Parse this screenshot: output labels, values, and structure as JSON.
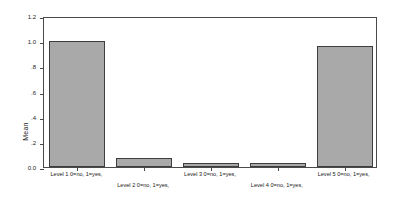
{
  "chart_data": {
    "type": "bar",
    "title": "",
    "subtitle": "",
    "xlabel": "",
    "ylabel": "Mean",
    "ylim": [
      0.0,
      1.2
    ],
    "grid": false,
    "legend": "none",
    "categories": [
      "Level 1 0=no, 1=yes,",
      "Level 2 0=no, 1=yes,",
      "Level 3 0=no, 1=yes,",
      "Level 4 0=no, 1=yes,",
      "Level 5 0=no, 1=yes,"
    ],
    "values": [
      1.0,
      0.07,
      0.03,
      0.03,
      0.96
    ],
    "ytick_labels": [
      "0.0",
      ".2",
      ".4",
      ".6",
      ".8",
      "1.0",
      "1.2"
    ],
    "ytick_values": [
      0.0,
      0.2,
      0.4,
      0.6,
      0.8,
      1.0,
      1.2
    ],
    "bar_fill_color": "#a9a9a9",
    "bar_border_color": "#3d3d3d",
    "frame_color": "#4a4a4a",
    "background_color": "#ffffff"
  }
}
